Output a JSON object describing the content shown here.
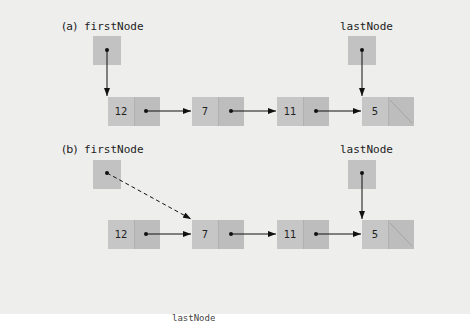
{
  "diagram": {
    "parts": [
      {
        "label": "(a)",
        "first_label": "firstNode",
        "last_label": "lastNode",
        "nodes": [
          "12",
          "7",
          "11",
          "5"
        ],
        "first_points_to": "12",
        "last_points_to": "5",
        "first_link_style": "solid"
      },
      {
        "label": "(b)",
        "first_label": "firstNode",
        "last_label": "lastNode",
        "nodes": [
          "12",
          "7",
          "11",
          "5"
        ],
        "first_points_to": "7",
        "last_points_to": "5",
        "first_link_style": "dashed"
      }
    ],
    "footer_truncated": "lastNode"
  },
  "colors": {
    "background": "#eeeeec",
    "node_fill": "#c6c6c6",
    "arrow": "#111111"
  }
}
